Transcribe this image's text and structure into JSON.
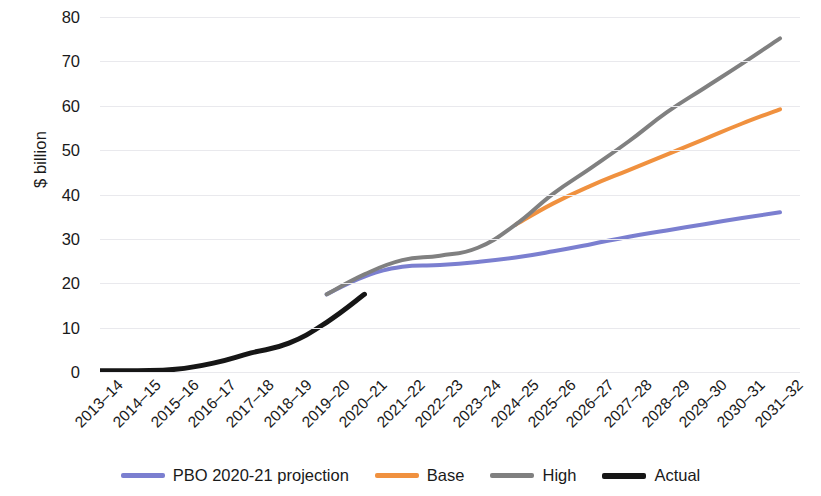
{
  "chart_data": {
    "type": "line",
    "title": "",
    "xlabel": "",
    "ylabel": "$ billion",
    "ylim": [
      0,
      80
    ],
    "yticks": [
      0,
      10,
      20,
      30,
      40,
      50,
      60,
      70,
      80
    ],
    "grid": true,
    "legend_position": "bottom",
    "categories": [
      "2013–14",
      "2014–15",
      "2015–16",
      "2016–17",
      "2017–18",
      "2018–19",
      "2019–20",
      "2020–21",
      "2021–22",
      "2022–23",
      "2023–24",
      "2024–25",
      "2025–26",
      "2026–27",
      "2027–28",
      "2028–29",
      "2029–30",
      "2030–31",
      "2031–32"
    ],
    "series": [
      {
        "name": "PBO 2020-21 projection",
        "color": "#7b7fd0",
        "width": 4,
        "values": [
          null,
          null,
          null,
          null,
          null,
          null,
          17.5,
          21.5,
          23.7,
          24.1,
          24.8,
          25.8,
          27.2,
          28.8,
          30.5,
          31.9,
          33.3,
          34.7,
          36.0
        ]
      },
      {
        "name": "Base",
        "color": "#f0913f",
        "width": 4,
        "values": [
          null,
          null,
          null,
          null,
          null,
          null,
          null,
          null,
          null,
          null,
          null,
          33.2,
          38.0,
          42.0,
          45.5,
          49.0,
          52.5,
          56.0,
          59.2
        ]
      },
      {
        "name": "High",
        "color": "#808080",
        "width": 4,
        "values": [
          null,
          null,
          null,
          null,
          null,
          null,
          17.5,
          22.0,
          25.2,
          26.2,
          28.0,
          33.2,
          40.2,
          46.0,
          52.0,
          58.5,
          64.0,
          69.5,
          75.2
        ]
      },
      {
        "name": "Actual",
        "color": "#161616",
        "width": 5,
        "values": [
          0.3,
          0.3,
          0.6,
          2.0,
          4.3,
          6.5,
          11.2,
          17.5,
          null,
          null,
          null,
          null,
          null,
          null,
          null,
          null,
          null,
          null,
          null
        ]
      }
    ]
  }
}
